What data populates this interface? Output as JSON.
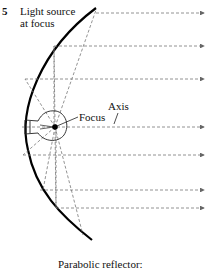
{
  "figure": {
    "number": "5",
    "source_label_line1": "Light source",
    "source_label_line2": "at focus",
    "focus_label": "Focus",
    "axis_label": "Axis",
    "caption": "Parabolic reflector:"
  },
  "colors": {
    "reflector": "#000000",
    "rays": "#777777",
    "text": "#111111"
  },
  "rays_y": [
    13,
    46,
    79,
    127,
    155,
    190,
    208
  ]
}
